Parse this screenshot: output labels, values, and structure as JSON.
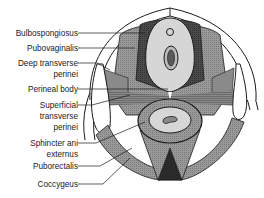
{
  "diagram": {
    "labels": [
      {
        "id": "bulbospongiosus",
        "text": "Bulbospongiosus"
      },
      {
        "id": "pubovaginalis",
        "text": "Pubovaginalis"
      },
      {
        "id": "deep-transverse-perinei",
        "line1": "Deep transverse",
        "line2": "perinei"
      },
      {
        "id": "perineal-body",
        "text": "Perineal body"
      },
      {
        "id": "superficial-transverse-perinei",
        "line1": "Superficial",
        "line2": "transverse",
        "line3": "perinei"
      },
      {
        "id": "sphincter-ani-externus",
        "line1": "Sphincter ani",
        "line2": "externus"
      },
      {
        "id": "puborectalis",
        "text": "Puborectalis"
      },
      {
        "id": "coccygeus",
        "text": "Coccygeus"
      }
    ],
    "colors": {
      "outline": "#1a1a1a",
      "light": "#d6d6d6",
      "mid": "#9a9a9a",
      "dark": "#5a5a5a",
      "darker": "#3a3a3a",
      "white": "#ffffff"
    }
  }
}
